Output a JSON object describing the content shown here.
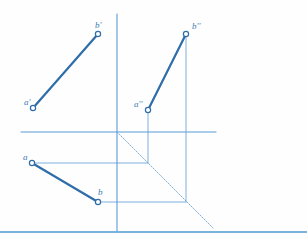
{
  "drawing": {
    "title": "Orthographic projection of line segment AB",
    "type": "technical-line-drawing",
    "canvas": {
      "width": 307,
      "height": 239,
      "background": "#fefefe"
    },
    "colors": {
      "segment": "#2e6da8",
      "construction": "#6fa8dc",
      "axis": "#5b9bd5",
      "marker_fill": "#ffffff",
      "label": "#3d7ab5",
      "border": "#4e9bd0"
    },
    "stroke_widths": {
      "segment": 2.2,
      "construction": 0.9,
      "axis": 1.1,
      "border": 1.4
    },
    "axes": {
      "origin": {
        "x": 117,
        "y": 132
      },
      "horizontal": {
        "x1": 21,
        "y1": 132,
        "x2": 216,
        "y2": 132
      },
      "vertical": {
        "x1": 117,
        "y1": 14,
        "x2": 117,
        "y2": 231
      },
      "miter_line": {
        "x1": 117,
        "y1": 132,
        "x2": 213,
        "y2": 228,
        "angle_deg": 45
      }
    },
    "bottom_border": {
      "x1": 0,
      "y1": 232,
      "x2": 307,
      "y2": 232
    },
    "points": [
      {
        "id": "a-prime",
        "label": "a'",
        "x": 33,
        "y": 108,
        "label_dx": -9,
        "label_dy": -10,
        "view": "frontal"
      },
      {
        "id": "b-prime",
        "label": "b'",
        "x": 98,
        "y": 34,
        "label_dx": -3,
        "label_dy": -13,
        "view": "frontal"
      },
      {
        "id": "a-double",
        "label": "a''",
        "x": 148,
        "y": 110,
        "label_dx": -14,
        "label_dy": -10,
        "view": "profile"
      },
      {
        "id": "b-double",
        "label": "b''",
        "x": 186,
        "y": 34,
        "label_dx": 6,
        "label_dy": -12,
        "view": "profile"
      },
      {
        "id": "a-plain",
        "label": "a",
        "x": 32,
        "y": 163,
        "label_dx": -9,
        "label_dy": -10,
        "view": "horizontal"
      },
      {
        "id": "b-plain",
        "label": "b",
        "x": 98,
        "y": 202,
        "label_dx": 0,
        "label_dy": -14,
        "view": "horizontal"
      }
    ],
    "segments": [
      {
        "id": "segment-frontal",
        "from": "a-prime",
        "to": "b-prime",
        "x1": 33,
        "y1": 108,
        "x2": 98,
        "y2": 34
      },
      {
        "id": "segment-profile",
        "from": "a-double",
        "to": "b-double",
        "x1": 148,
        "y1": 110,
        "x2": 186,
        "y2": 34
      },
      {
        "id": "segment-horizontal",
        "from": "a-plain",
        "to": "b-plain",
        "x1": 32,
        "y1": 163,
        "x2": 98,
        "y2": 202
      }
    ],
    "construction_lines": [
      {
        "id": "vline-b-double",
        "x1": 186,
        "y1": 34,
        "x2": 186,
        "y2": 202
      },
      {
        "id": "vline-a-double",
        "x1": 148,
        "y1": 110,
        "x2": 148,
        "y2": 163
      },
      {
        "id": "hline-a-plain",
        "x1": 32,
        "y1": 163,
        "x2": 148,
        "y2": 163
      },
      {
        "id": "hline-b-plain",
        "x1": 98,
        "y1": 202,
        "x2": 186,
        "y2": 202
      }
    ],
    "marker": {
      "radius": 2.6,
      "stroke_width": 1.2
    }
  }
}
